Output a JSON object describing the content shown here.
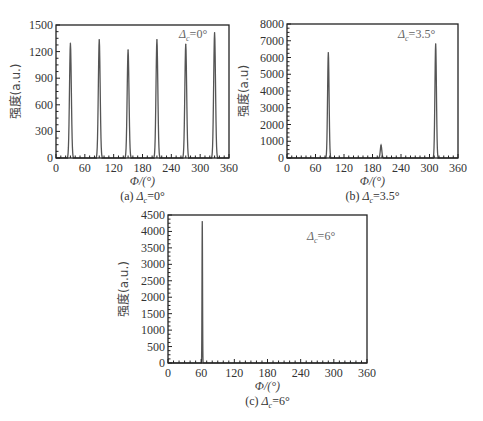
{
  "chart_data": [
    {
      "id": "a",
      "type": "line",
      "title": "",
      "caption": "(a) Δc=0°",
      "caption_prefix": "(a) ",
      "caption_symbol": "Δ",
      "caption_sub": "c",
      "caption_value": "=0°",
      "annotation_symbol": "Δ",
      "annotation_sub": "c",
      "annotation_value": "=0°",
      "legend_position": "top-right",
      "xlabel": "Φ/(°)",
      "ylabel": "强度(a.u.)",
      "xlim": [
        0,
        360
      ],
      "ylim": [
        0,
        1500
      ],
      "xticks": [
        0,
        60,
        120,
        180,
        240,
        300,
        360
      ],
      "yticks": [
        0,
        300,
        600,
        900,
        1200,
        1500
      ],
      "grid": false,
      "peak_halfwidth_deg": 6,
      "peaks": [
        {
          "x": 30,
          "y": 1295
        },
        {
          "x": 90,
          "y": 1335
        },
        {
          "x": 150,
          "y": 1220
        },
        {
          "x": 210,
          "y": 1335
        },
        {
          "x": 270,
          "y": 1285
        },
        {
          "x": 330,
          "y": 1415
        }
      ]
    },
    {
      "id": "b",
      "type": "line",
      "title": "",
      "caption": "(b) Δc=3.5°",
      "caption_prefix": "(b) ",
      "caption_symbol": "Δ",
      "caption_sub": "c",
      "caption_value": "=3.5°",
      "annotation_symbol": "Δ",
      "annotation_sub": "c",
      "annotation_value": "=3.5°",
      "legend_position": "top-right",
      "xlabel": "Φ/(°)",
      "ylabel": "强度(a.u)",
      "xlim": [
        0,
        360
      ],
      "ylim": [
        0,
        8000
      ],
      "xticks": [
        0,
        60,
        120,
        180,
        240,
        300,
        360
      ],
      "yticks": [
        0,
        1000,
        2000,
        3000,
        4000,
        5000,
        6000,
        7000,
        8000
      ],
      "grid": false,
      "peak_halfwidth_deg": 5,
      "peaks": [
        {
          "x": 87,
          "y": 6300
        },
        {
          "x": 198,
          "y": 760
        },
        {
          "x": 313,
          "y": 6820
        }
      ]
    },
    {
      "id": "c",
      "type": "line",
      "title": "",
      "caption": "(c) Δc=6°",
      "caption_prefix": "(c) ",
      "caption_symbol": "Δ",
      "caption_sub": "c",
      "caption_value": "=6°",
      "annotation_symbol": "Δ",
      "annotation_sub": "c",
      "annotation_value": "=6°",
      "legend_position": "top-right",
      "xlabel": "Φ/(°)",
      "ylabel": "强度(a.u.)",
      "xlim": [
        0,
        360
      ],
      "ylim": [
        0,
        4500
      ],
      "xticks": [
        0,
        60,
        120,
        180,
        240,
        300,
        360
      ],
      "yticks": [
        0,
        500,
        1000,
        1500,
        2000,
        2500,
        3000,
        3500,
        4000,
        4500
      ],
      "grid": false,
      "peak_halfwidth_deg": 1.5,
      "peaks": [
        {
          "x": 62,
          "y": 4300
        }
      ]
    }
  ]
}
